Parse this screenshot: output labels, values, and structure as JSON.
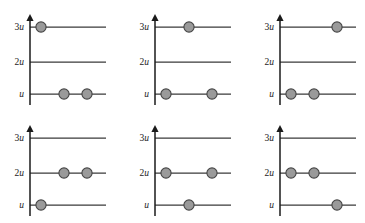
{
  "figure": {
    "type": "energy-level-occupancy-diagram",
    "background_color": "#ffffff",
    "line_color": "#3a3a3a",
    "axis_color": "#1a1a1a",
    "marker_fill": "#9a9a9a",
    "marker_stroke": "#444444",
    "levels": [
      {
        "key": "level-3u",
        "coefficient": "3",
        "symbol": "u",
        "label": "3u",
        "value": 3
      },
      {
        "key": "level-2u",
        "coefficient": "2",
        "symbol": "u",
        "label": "2u",
        "value": 2
      },
      {
        "key": "level-u",
        "coefficient": "",
        "symbol": "u",
        "label": "u",
        "value": 1
      }
    ],
    "slots": [
      1,
      2,
      3
    ],
    "panels": [
      {
        "name": "panel-1",
        "index": 1,
        "occupancy": [
          {
            "level": "3u",
            "slots": [
              1
            ]
          },
          {
            "level": "2u",
            "slots": []
          },
          {
            "level": "u",
            "slots": [
              2,
              3
            ]
          }
        ]
      },
      {
        "name": "panel-2",
        "index": 2,
        "occupancy": [
          {
            "level": "3u",
            "slots": [
              2
            ]
          },
          {
            "level": "2u",
            "slots": []
          },
          {
            "level": "u",
            "slots": [
              1,
              3
            ]
          }
        ]
      },
      {
        "name": "panel-3",
        "index": 3,
        "occupancy": [
          {
            "level": "3u",
            "slots": [
              3
            ]
          },
          {
            "level": "2u",
            "slots": []
          },
          {
            "level": "u",
            "slots": [
              1,
              2
            ]
          }
        ]
      },
      {
        "name": "panel-4",
        "index": 4,
        "occupancy": [
          {
            "level": "3u",
            "slots": []
          },
          {
            "level": "2u",
            "slots": [
              2,
              3
            ]
          },
          {
            "level": "u",
            "slots": [
              1
            ]
          }
        ]
      },
      {
        "name": "panel-5",
        "index": 5,
        "occupancy": [
          {
            "level": "3u",
            "slots": []
          },
          {
            "level": "2u",
            "slots": [
              1,
              3
            ]
          },
          {
            "level": "u",
            "slots": [
              2
            ]
          }
        ]
      },
      {
        "name": "panel-6",
        "index": 6,
        "occupancy": [
          {
            "level": "3u",
            "slots": []
          },
          {
            "level": "2u",
            "slots": [
              1,
              2
            ]
          },
          {
            "level": "u",
            "slots": [
              3
            ]
          }
        ]
      }
    ]
  }
}
